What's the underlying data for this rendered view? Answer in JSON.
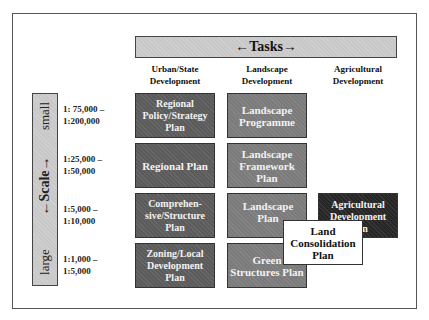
{
  "tasks_header": {
    "label": "←Tasks→"
  },
  "columns": [
    {
      "label": "Urban/State Development"
    },
    {
      "label": "Landscape Development"
    },
    {
      "label": "Agricultural Development"
    }
  ],
  "scale_axis": {
    "top_label": "small",
    "middle_label": "←Scale→",
    "bottom_label": "large"
  },
  "scale_ranges": [
    {
      "line1": "1: 75,000 –",
      "line2": "1:200,000"
    },
    {
      "line1": "1:25,000 –",
      "line2": "1:50,000"
    },
    {
      "line1": "1:5,000 –",
      "line2": "1:10,000"
    },
    {
      "line1": "1:1,000 –",
      "line2": "1:5,000"
    }
  ],
  "urban_plans": [
    "Regional Policy/Strategy Plan",
    "Regional Plan",
    "Comprehen-sive/Structure Plan",
    "Zoning/Local Development Plan"
  ],
  "landscape_plans": [
    "Landscape Programme",
    "Landscape Framework Plan",
    "Landscape Plan",
    "Green Structures Plan"
  ],
  "agricultural_plans": [
    "Agricultural Development Plan"
  ],
  "overlay_plan": "Land Consolidation Plan",
  "colors": {
    "urban_box": "#5b5b5b",
    "landscape_box": "#7b7b7b",
    "agricultural_box": "#262626",
    "header_bar": "#c8c8c8"
  }
}
